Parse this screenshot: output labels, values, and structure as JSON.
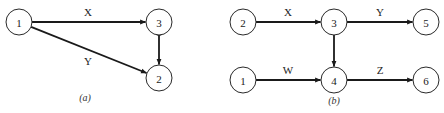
{
  "diagrams": [
    {
      "id": "a",
      "caption": "(a)",
      "caption_pos": [
        85,
        101
      ],
      "nodes": [
        {
          "id": "1",
          "label": "1",
          "cx": 19,
          "cy": 22
        },
        {
          "id": "3",
          "label": "3",
          "cx": 159,
          "cy": 22
        },
        {
          "id": "2",
          "label": "2",
          "cx": 159,
          "cy": 78
        }
      ],
      "edges": [
        {
          "from": "1",
          "to": "3",
          "label": "X",
          "label_pos": [
            88,
            16
          ],
          "bidirectional": false
        },
        {
          "from": "1",
          "to": "2",
          "label": "Y",
          "label_pos": [
            88,
            65
          ],
          "bidirectional": false
        },
        {
          "from": "3",
          "to": "2",
          "label": "",
          "label_pos": null,
          "bidirectional": true
        }
      ]
    },
    {
      "id": "b",
      "caption": "(b)",
      "caption_pos": [
        334,
        104
      ],
      "nodes": [
        {
          "id": "2",
          "label": "2",
          "cx": 243,
          "cy": 22
        },
        {
          "id": "3",
          "label": "3",
          "cx": 334,
          "cy": 22
        },
        {
          "id": "5",
          "label": "5",
          "cx": 426,
          "cy": 22
        },
        {
          "id": "1",
          "label": "1",
          "cx": 243,
          "cy": 80
        },
        {
          "id": "4",
          "label": "4",
          "cx": 334,
          "cy": 80
        },
        {
          "id": "6",
          "label": "6",
          "cx": 426,
          "cy": 80
        }
      ],
      "edges": [
        {
          "from": "2",
          "to": "3",
          "label": "X",
          "label_pos": [
            288,
            16
          ],
          "bidirectional": false
        },
        {
          "from": "3",
          "to": "5",
          "label": "Y",
          "label_pos": [
            380,
            16
          ],
          "bidirectional": false
        },
        {
          "from": "1",
          "to": "4",
          "label": "W",
          "label_pos": [
            288,
            74
          ],
          "bidirectional": false
        },
        {
          "from": "4",
          "to": "6",
          "label": "Z",
          "label_pos": [
            380,
            74
          ],
          "bidirectional": false
        },
        {
          "from": "3",
          "to": "4",
          "label": "",
          "label_pos": null,
          "bidirectional": false
        }
      ]
    }
  ],
  "style": {
    "node_radius": 13,
    "stroke_color": "#1a1a1a",
    "background": "#ffffff"
  }
}
